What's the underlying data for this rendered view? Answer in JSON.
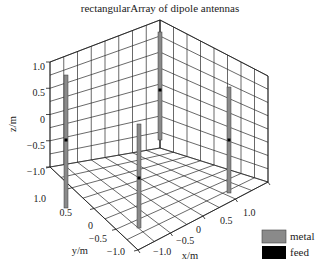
{
  "chart_data": {
    "type": "3d-structure",
    "title": "rectangularArray of dipole antennas",
    "xlabel": "x/m",
    "ylabel": "y/m",
    "zlabel": "z/m",
    "xlim": [
      -1.0,
      1.0
    ],
    "ylim": [
      -1.0,
      1.0
    ],
    "zlim": [
      -1.0,
      1.0
    ],
    "x_ticks": [
      "-1.0",
      "-0.5",
      "0",
      "0.5",
      "1.0"
    ],
    "y_ticks": [
      "1.0",
      "0.5",
      "0",
      "-0.5",
      "-1.0"
    ],
    "z_ticks": [
      "1.0",
      "0.5",
      "0",
      "-0.5",
      "-1.0"
    ],
    "grid": true,
    "antennas": [
      {
        "name": "dipole-1",
        "x": -0.5,
        "y": 0.5,
        "z_range": [
          -0.9,
          0.9
        ],
        "feed_z": 0
      },
      {
        "name": "dipole-2",
        "x": 0.5,
        "y": 0.5,
        "z_range": [
          -0.9,
          0.9
        ],
        "feed_z": 0
      },
      {
        "name": "dipole-3",
        "x": -0.5,
        "y": -0.5,
        "z_range": [
          -0.9,
          0.9
        ],
        "feed_z": 0
      },
      {
        "name": "dipole-4",
        "x": 0.5,
        "y": -0.5,
        "z_range": [
          -0.9,
          0.9
        ],
        "feed_z": 0
      }
    ],
    "legend": [
      {
        "label": "metal",
        "color": "#8a8a8a"
      },
      {
        "label": "feed",
        "color": "#000000"
      }
    ],
    "legend_position": "bottom-right"
  },
  "labels": {
    "title": "rectangularArray of dipole antennas",
    "z_axis": "z/m",
    "y_axis": "y/m",
    "x_axis": "x/m",
    "z_ticks": [
      "1.0",
      "0.5",
      "0",
      "−0.5",
      "−1.0"
    ],
    "y_ticks": [
      "1.0",
      "0.5",
      "0",
      "−0.5",
      "−1.0"
    ],
    "x_ticks": [
      "−1.0",
      "−0.5",
      "0",
      "0.5",
      "1.0"
    ],
    "legend_metal": "metal",
    "legend_feed": "feed"
  },
  "colors": {
    "metal": "#8a8a8a",
    "feed": "#000000"
  }
}
